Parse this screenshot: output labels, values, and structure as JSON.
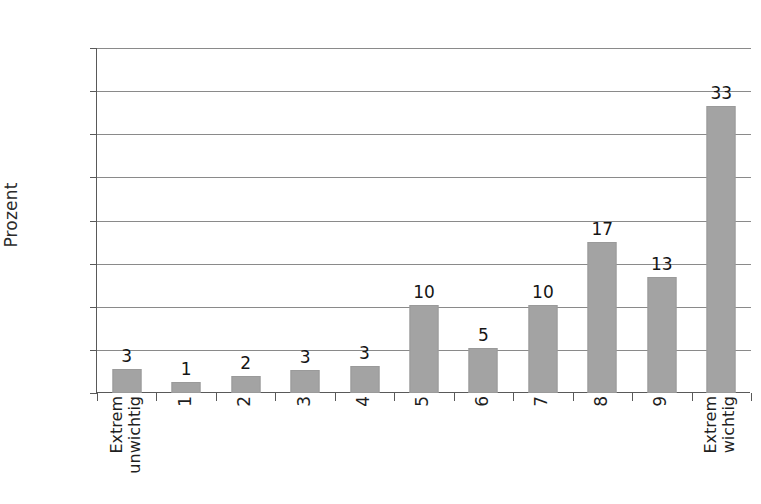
{
  "chart_data": {
    "type": "bar",
    "title": "",
    "subtitle": "",
    "xlabel": "",
    "ylabel": "Prozent",
    "ylim": [
      0,
      40
    ],
    "yticks": [
      0,
      5,
      10,
      15,
      20,
      25,
      30,
      35,
      40
    ],
    "ytick_labels": [
      "0",
      "5",
      "10",
      "15",
      "20",
      "25",
      "30",
      "35",
      "40"
    ],
    "grid": true,
    "legend": false,
    "legend_position": "none",
    "bar_color": "#a3a3a3",
    "categories": [
      "Extrem unwichtig",
      "1",
      "2",
      "3",
      "4",
      "5",
      "6",
      "7",
      "8",
      "9",
      "Extrem wichtig"
    ],
    "category_lines": [
      [
        "Extrem",
        "unwichtig"
      ],
      [
        "1"
      ],
      [
        "2"
      ],
      [
        "3"
      ],
      [
        "4"
      ],
      [
        "5"
      ],
      [
        "6"
      ],
      [
        "7"
      ],
      [
        "8"
      ],
      [
        "9"
      ],
      [
        "Extrem",
        "wichtig"
      ]
    ],
    "values": [
      2.8,
      1.3,
      2.0,
      2.7,
      3.1,
      10.2,
      5.2,
      10.2,
      17.5,
      13.4,
      33.3
    ],
    "data_labels": [
      "3",
      "1",
      "2",
      "3",
      "3",
      "10",
      "5",
      "10",
      "17",
      "13",
      "33"
    ]
  }
}
